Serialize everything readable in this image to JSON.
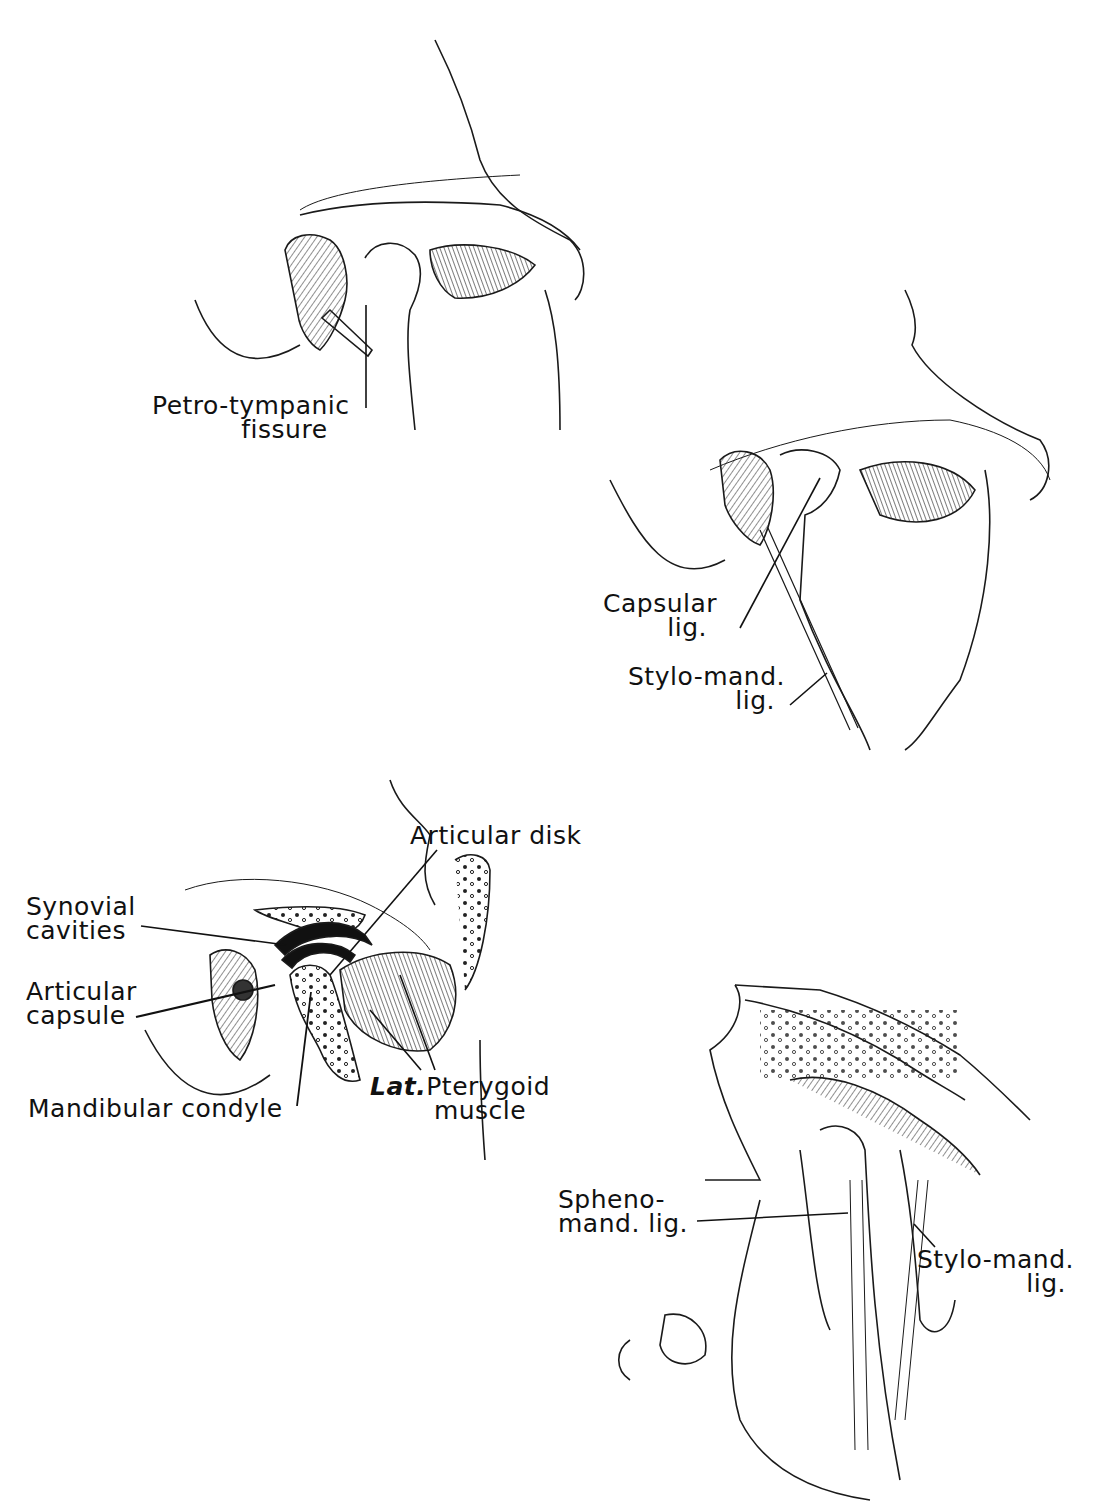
{
  "figures": [
    {
      "id": "fig-top-left",
      "labels": [
        {
          "key": "petro_tympanic",
          "lines": [
            "Petro-tympanic",
            "fissure"
          ]
        }
      ]
    },
    {
      "id": "fig-top-right",
      "labels": [
        {
          "key": "capsular_lig",
          "lines": [
            "Capsular",
            "lig."
          ]
        },
        {
          "key": "stylo_mand_1",
          "lines": [
            "Stylo-mand.",
            "lig."
          ]
        }
      ]
    },
    {
      "id": "fig-middle-left",
      "labels": [
        {
          "key": "articular_disk",
          "lines": [
            "Articular disk"
          ]
        },
        {
          "key": "synovial",
          "lines": [
            "Synovial",
            "cavities"
          ]
        },
        {
          "key": "articular_capsule",
          "lines": [
            "Articular",
            "capsule"
          ]
        },
        {
          "key": "mandibular_condyle",
          "lines": [
            "Mandibular condyle"
          ]
        },
        {
          "key": "lat_pterygoid",
          "prefix": "Lat.",
          "lines": [
            "Pterygoid",
            "muscle"
          ]
        }
      ]
    },
    {
      "id": "fig-bottom-right",
      "labels": [
        {
          "key": "spheno_mand",
          "lines": [
            "Spheno-",
            "mand. lig."
          ]
        },
        {
          "key": "stylo_mand_2",
          "lines": [
            "Stylo-mand.",
            "lig."
          ]
        }
      ]
    }
  ]
}
